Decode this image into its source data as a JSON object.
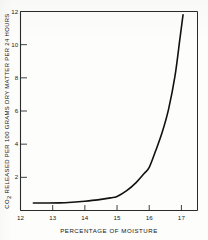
{
  "figure": {
    "background_color": "#fdfdfc",
    "ink_color": "#141414"
  },
  "chart_data": {
    "type": "line",
    "title": "",
    "subtitle": "",
    "xlabel": "PERCENTAGE OF MOISTURE",
    "ylabel": "CO2 RELEASED PER 100 GRAMS DRY MATTER PER 24 HOURS",
    "ylabel_parts": {
      "prefix": "CO",
      "subscript": "2",
      "rest": " RELEASED PER 100 GRAMS DRY MATTER PER 24 HOURS"
    },
    "xlim": [
      12,
      17.5
    ],
    "ylim": [
      0,
      12
    ],
    "xticks": [
      12,
      13,
      14,
      15,
      16,
      17
    ],
    "xtick_labels": [
      "12",
      "13",
      "14",
      "15",
      "16",
      "17"
    ],
    "yticks": [
      2,
      4,
      6,
      8,
      10,
      12
    ],
    "ytick_labels": [
      "2",
      "4",
      "6",
      "8",
      "10",
      "12"
    ],
    "grid": false,
    "legend": false,
    "legend_position": "none",
    "series": [
      {
        "name": "CO2 release vs moisture",
        "color": "#111111",
        "line_width": 1.6,
        "x": [
          12.4,
          12.8,
          13.2,
          13.6,
          14.0,
          14.4,
          14.8,
          15.0,
          15.3,
          15.6,
          15.85,
          16.0,
          16.2,
          16.4,
          16.6,
          16.8,
          16.95,
          17.05
        ],
        "y": [
          0.45,
          0.45,
          0.46,
          0.5,
          0.56,
          0.64,
          0.76,
          0.85,
          1.2,
          1.7,
          2.25,
          2.6,
          3.6,
          4.7,
          6.1,
          8.1,
          10.3,
          11.8
        ]
      }
    ],
    "annotations": []
  },
  "axis_labels": {
    "x_axis_title": "PERCENTAGE OF MOISTURE",
    "y_axis_title": "CO2 RELEASED PER 100 GRAMS DRY MATTER PER 24 HOURS"
  }
}
